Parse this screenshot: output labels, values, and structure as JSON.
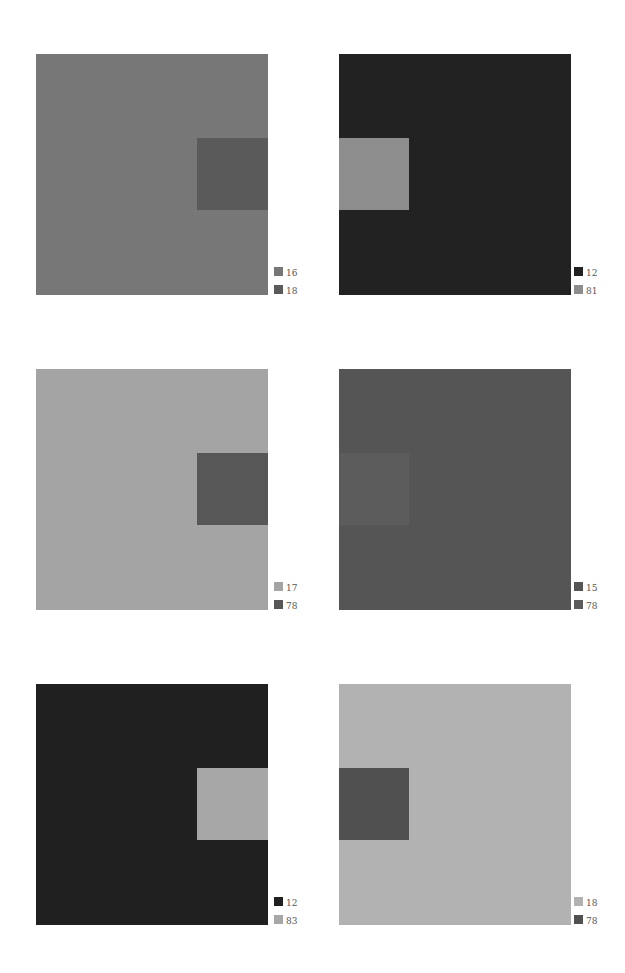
{
  "panels": [
    {
      "id": "p1",
      "bg": "#777777",
      "inner": "#5a5a5a",
      "inner_side": "right",
      "legend": [
        {
          "color": "#777777",
          "label": "16"
        },
        {
          "color": "#5a5a5a",
          "label": "18"
        }
      ]
    },
    {
      "id": "p2",
      "bg": "#222222",
      "inner": "#8d8d8d",
      "inner_side": "left",
      "legend": [
        {
          "color": "#222222",
          "label": "12"
        },
        {
          "color": "#8d8d8d",
          "label": "81"
        }
      ]
    },
    {
      "id": "p3",
      "bg": "#a4a4a4",
      "inner": "#575757",
      "inner_side": "right",
      "legend": [
        {
          "color": "#a4a4a4",
          "label": "17"
        },
        {
          "color": "#575757",
          "label": "78"
        }
      ]
    },
    {
      "id": "p4",
      "bg": "#555555",
      "inner": "#5c5c5c",
      "inner_side": "left",
      "legend": [
        {
          "color": "#555555",
          "label": "15"
        },
        {
          "color": "#5c5c5c",
          "label": "78"
        }
      ]
    },
    {
      "id": "p5",
      "bg": "#202020",
      "inner": "#a7a7a7",
      "inner_side": "right",
      "legend": [
        {
          "color": "#202020",
          "label": "12"
        },
        {
          "color": "#a7a7a7",
          "label": "83"
        }
      ]
    },
    {
      "id": "p6",
      "bg": "#b2b2b2",
      "inner": "#505050",
      "inner_side": "left",
      "legend": [
        {
          "color": "#b2b2b2",
          "label": "18"
        },
        {
          "color": "#505050",
          "label": "78"
        }
      ]
    }
  ]
}
